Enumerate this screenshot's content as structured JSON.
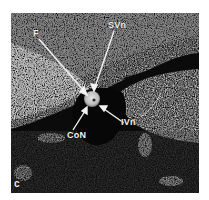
{
  "figure": {
    "panel_letter": "c",
    "labels": {
      "f": "F",
      "svn": "SVn",
      "con": "CoN",
      "ivn": "IVn"
    },
    "colors": {
      "background": "#ffffff",
      "dark_tissue": "#0b0b0b",
      "bright_tissue": "#d8d8d8",
      "label": "#f2f2f2"
    }
  }
}
